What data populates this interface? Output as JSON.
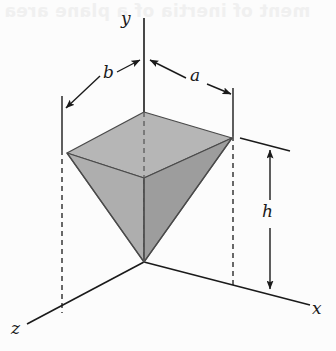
{
  "figure": {
    "caption_hidden": "",
    "background_color": "#fcfcfc",
    "ink_color": "#1a1a1a",
    "solid_fill_top": "#b5b5b5",
    "solid_fill_left": "#a8a8a8",
    "solid_fill_right": "#9a9a9a",
    "solid_fill_inner": "#c2c2c2"
  },
  "axes": {
    "y": {
      "label": "y",
      "x": 125,
      "y": 13
    },
    "x": {
      "label": "x",
      "x": 313,
      "y": 303
    },
    "z": {
      "label": "z",
      "x": 12,
      "y": 322
    }
  },
  "dimensions": [
    {
      "name": "b",
      "label": "b",
      "x": 100,
      "y": 70,
      "description": "half-width along z from y-axis to left vertex"
    },
    {
      "name": "a",
      "label": "a",
      "x": 190,
      "y": 73,
      "description": "half-width along x from y-axis to right vertex"
    },
    {
      "name": "h",
      "label": "h",
      "x": 262,
      "y": 205,
      "description": "height of pyramid from apex at origin to top face"
    }
  ],
  "bleed_through": {
    "text": "ment of inertia of a plane area"
  },
  "geometry": {
    "origin": {
      "x": 144,
      "y": 262
    },
    "top_face": {
      "left": {
        "x": 67,
        "y": 153
      },
      "back": {
        "x": 144,
        "y": 112
      },
      "right": {
        "x": 232,
        "y": 138
      },
      "front": {
        "x": 144,
        "y": 178
      }
    },
    "dashed_verticals": [
      {
        "x": 62,
        "y1": 153,
        "y2": 312
      },
      {
        "x": 233,
        "y1": 138,
        "y2": 288
      },
      {
        "x": 144,
        "y1": 112,
        "y2": 262
      }
    ]
  }
}
